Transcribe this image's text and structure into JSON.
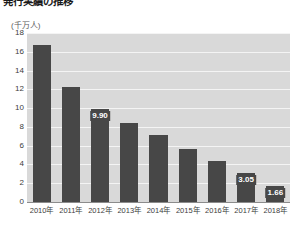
{
  "title": "発行実績の推移",
  "unit_label": "(千万人)",
  "colors": {
    "bar": "#474747",
    "plot_background": "#d9d9d9",
    "gridline": "#f4f4f4",
    "axis": "#8c8c8c",
    "tick_text": "#3d3d3d",
    "label_text": "#ffffff"
  },
  "chart_data": {
    "type": "bar",
    "title": "発行実績の推移",
    "xlabel": "",
    "ylabel": "(千万人)",
    "ylim": [
      0,
      18
    ],
    "ytick_values": [
      18,
      16,
      14,
      12,
      10,
      8,
      6,
      4,
      2,
      0
    ],
    "ytick_labels": [
      "18",
      "16",
      "14",
      "12",
      "10",
      "8",
      "6",
      "4",
      "2",
      "0"
    ],
    "grid": true,
    "legend": false,
    "categories": [
      "2010年",
      "2011年",
      "2012年",
      "2013年",
      "2014年",
      "2015年",
      "2016年",
      "2017年",
      "2018年"
    ],
    "values": [
      16.7,
      12.3,
      9.9,
      8.4,
      7.1,
      5.65,
      4.35,
      3.05,
      1.66
    ],
    "data_labels": [
      null,
      null,
      "9.90",
      null,
      null,
      null,
      null,
      "3.05",
      "1.66"
    ]
  }
}
